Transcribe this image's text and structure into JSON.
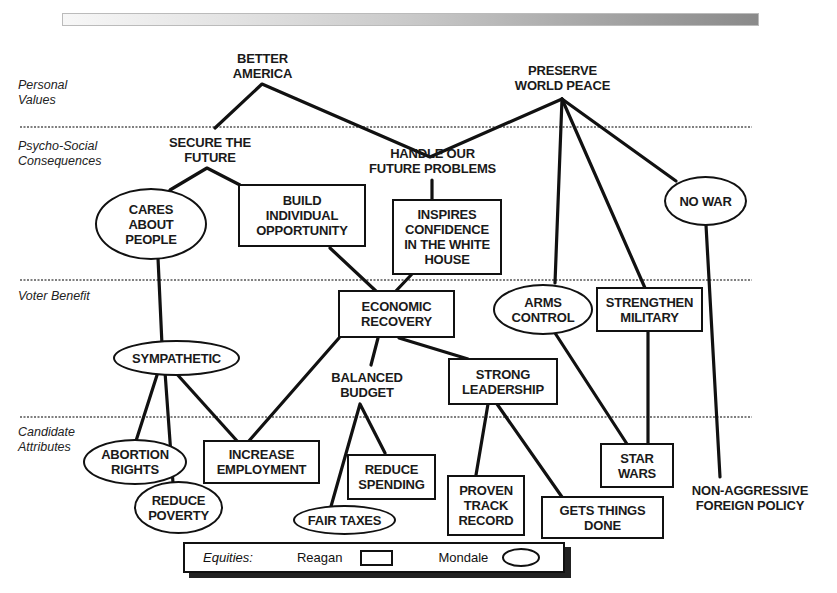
{
  "diagram": {
    "title_partial": "",
    "levels": [
      {
        "id": "personal-values",
        "label": "Personal\nValues"
      },
      {
        "id": "psycho-social",
        "label": "Psycho-Social\nConsequences"
      },
      {
        "id": "voter-benefit",
        "label": "Voter Benefit"
      },
      {
        "id": "candidate-attributes",
        "label": "Candidate\nAttributes"
      }
    ],
    "nodes": {
      "better_america": {
        "label": "BETTER\nAMERICA",
        "shape": "plain",
        "level": "personal-values"
      },
      "preserve_world_peace": {
        "label": "PRESERVE\nWORLD PEACE",
        "shape": "plain",
        "level": "personal-values"
      },
      "secure_the_future": {
        "label": "SECURE THE\nFUTURE",
        "shape": "plain",
        "level": "psycho-social"
      },
      "handle_future_problems": {
        "label": "HANDLE OUR\nFUTURE PROBLEMS",
        "shape": "plain",
        "level": "psycho-social"
      },
      "cares_about_people": {
        "label": "CARES\nABOUT\nPEOPLE",
        "shape": "oval",
        "equity": "Mondale"
      },
      "build_individual_opportunity": {
        "label": "BUILD\nINDIVIDUAL\nOPPORTUNITY",
        "shape": "rect",
        "equity": "Reagan"
      },
      "inspires_confidence": {
        "label": "INSPIRES\nCONFIDENCE\nIN THE WHITE\nHOUSE",
        "shape": "rect",
        "equity": "Reagan"
      },
      "no_war": {
        "label": "NO WAR",
        "shape": "oval",
        "equity": "Mondale"
      },
      "economic_recovery": {
        "label": "ECONOMIC\nRECOVERY",
        "shape": "rect",
        "equity": "Reagan"
      },
      "arms_control": {
        "label": "ARMS\nCONTROL",
        "shape": "oval",
        "equity": "Mondale"
      },
      "strengthen_military": {
        "label": "STRENGTHEN\nMILITARY",
        "shape": "rect",
        "equity": "Reagan"
      },
      "sympathetic": {
        "label": "SYMPATHETIC",
        "shape": "oval",
        "equity": "Mondale"
      },
      "balanced_budget": {
        "label": "BALANCED\nBUDGET",
        "shape": "plain"
      },
      "strong_leadership": {
        "label": "STRONG\nLEADERSHIP",
        "shape": "rect",
        "equity": "Reagan"
      },
      "abortion_rights": {
        "label": "ABORTION\nRIGHTS",
        "shape": "oval",
        "equity": "Mondale"
      },
      "reduce_poverty": {
        "label": "REDUCE\nPOVERTY",
        "shape": "oval",
        "equity": "Mondale"
      },
      "increase_employment": {
        "label": "INCREASE\nEMPLOYMENT",
        "shape": "rect",
        "equity": "Reagan"
      },
      "reduce_spending": {
        "label": "REDUCE\nSPENDING",
        "shape": "rect",
        "equity": "Reagan"
      },
      "fair_taxes": {
        "label": "FAIR TAXES",
        "shape": "oval",
        "equity": "Mondale"
      },
      "proven_track_record": {
        "label": "PROVEN\nTRACK\nRECORD",
        "shape": "rect",
        "equity": "Reagan"
      },
      "gets_things_done": {
        "label": "GETS THINGS\nDONE",
        "shape": "rect",
        "equity": "Reagan"
      },
      "star_wars": {
        "label": "STAR\nWARS",
        "shape": "rect",
        "equity": "Reagan"
      },
      "non_aggressive_foreign_policy": {
        "label": "NON-AGGRESSIVE\nFOREIGN POLICY",
        "shape": "plain"
      }
    },
    "edges": [
      [
        "better_america",
        "secure_the_future"
      ],
      [
        "better_america",
        "handle_future_problems"
      ],
      [
        "preserve_world_peace",
        "handle_future_problems"
      ],
      [
        "preserve_world_peace",
        "arms_control"
      ],
      [
        "preserve_world_peace",
        "strengthen_military"
      ],
      [
        "preserve_world_peace",
        "no_war"
      ],
      [
        "secure_the_future",
        "cares_about_people"
      ],
      [
        "secure_the_future",
        "build_individual_opportunity"
      ],
      [
        "handle_future_problems",
        "inspires_confidence"
      ],
      [
        "build_individual_opportunity",
        "economic_recovery"
      ],
      [
        "inspires_confidence",
        "economic_recovery"
      ],
      [
        "cares_about_people",
        "sympathetic"
      ],
      [
        "no_war",
        "non_aggressive_foreign_policy"
      ],
      [
        "economic_recovery",
        "increase_employment"
      ],
      [
        "economic_recovery",
        "balanced_budget"
      ],
      [
        "economic_recovery",
        "strong_leadership"
      ],
      [
        "arms_control",
        "star_wars"
      ],
      [
        "strengthen_military",
        "star_wars"
      ],
      [
        "sympathetic",
        "abortion_rights"
      ],
      [
        "sympathetic",
        "reduce_poverty"
      ],
      [
        "sympathetic",
        "increase_employment"
      ],
      [
        "balanced_budget",
        "fair_taxes"
      ],
      [
        "balanced_budget",
        "reduce_spending"
      ],
      [
        "strong_leadership",
        "proven_track_record"
      ],
      [
        "strong_leadership",
        "gets_things_done"
      ]
    ]
  },
  "legend": {
    "label": "Equities:",
    "reagan_label": "Reagan",
    "reagan_shape": "rectangle",
    "mondale_label": "Mondale",
    "mondale_shape": "oval"
  }
}
